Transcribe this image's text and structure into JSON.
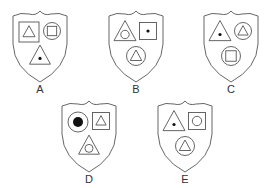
{
  "colors": {
    "stroke": "#555555",
    "fill_dot": "#111111",
    "background": "#ffffff"
  },
  "shields": [
    {
      "label": "A",
      "symbols": [
        {
          "slot": "top-left",
          "outer": "square",
          "inner": "triangle",
          "inner_fill": "none"
        },
        {
          "slot": "top-right",
          "outer": "circle",
          "inner": "square",
          "inner_fill": "none"
        },
        {
          "slot": "bottom",
          "outer": "triangle",
          "inner": "dot",
          "inner_fill": "solid"
        }
      ]
    },
    {
      "label": "B",
      "symbols": [
        {
          "slot": "top-left",
          "outer": "triangle",
          "inner": "circle",
          "inner_fill": "none"
        },
        {
          "slot": "top-right",
          "outer": "square",
          "inner": "dot",
          "inner_fill": "solid"
        },
        {
          "slot": "bottom",
          "outer": "circle",
          "inner": "triangle",
          "inner_fill": "none"
        }
      ]
    },
    {
      "label": "C",
      "symbols": [
        {
          "slot": "top-left",
          "outer": "triangle",
          "inner": "dot",
          "inner_fill": "solid"
        },
        {
          "slot": "top-right",
          "outer": "circle",
          "inner": "triangle",
          "inner_fill": "none"
        },
        {
          "slot": "bottom",
          "outer": "circle",
          "inner": "square",
          "inner_fill": "none"
        }
      ]
    },
    {
      "label": "D",
      "symbols": [
        {
          "slot": "top-left",
          "outer": "circle",
          "inner": "dot-large",
          "inner_fill": "solid"
        },
        {
          "slot": "top-right",
          "outer": "square",
          "inner": "triangle",
          "inner_fill": "none"
        },
        {
          "slot": "bottom",
          "outer": "triangle",
          "inner": "circle",
          "inner_fill": "none"
        }
      ]
    },
    {
      "label": "E",
      "symbols": [
        {
          "slot": "top-left",
          "outer": "triangle",
          "inner": "dot",
          "inner_fill": "solid"
        },
        {
          "slot": "top-right",
          "outer": "square",
          "inner": "circle",
          "inner_fill": "none"
        },
        {
          "slot": "bottom",
          "outer": "circle",
          "inner": "triangle",
          "inner_fill": "none"
        }
      ]
    }
  ]
}
